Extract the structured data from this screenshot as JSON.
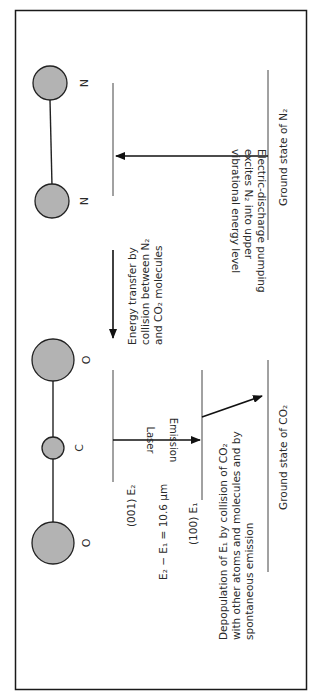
{
  "figure": {
    "colors": {
      "frame": "#1a1a1a",
      "atom_fill": "#b3b3b3",
      "atom_stroke": "#222222",
      "line": "#444444",
      "arrow": "#111111",
      "text": "#2a2a2a"
    }
  },
  "n2": {
    "atoms": [
      "N",
      "N"
    ],
    "pump_text": [
      "Electric-discharge pumping",
      "excites N₂ into upper",
      "vibrational energy level"
    ],
    "ground_label": "Ground state of N₂"
  },
  "transfer": {
    "text": [
      "Energy transfer by",
      "collision between N₂",
      "and CO₂ molecules"
    ]
  },
  "co2": {
    "atoms": [
      "O",
      "C",
      "O"
    ],
    "upper_level": "(001) E₂",
    "lower_level": "(100) E₁",
    "laser_label": "Laser",
    "emission_label": "Emission",
    "equation": "E₂ − E₁ = 10.6 μm",
    "depopulation_text": [
      "Depopulation of E₁ by collision of CO₂",
      "with other atoms and molecules and by",
      "spontaneous emission"
    ],
    "ground_label": "Ground state of CO₂"
  }
}
